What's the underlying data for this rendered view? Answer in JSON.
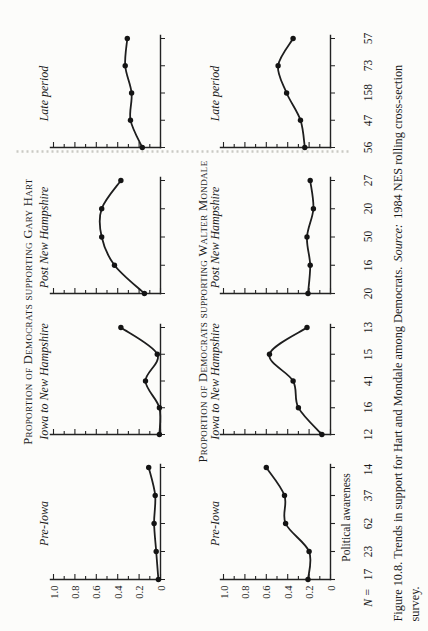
{
  "chart_data": {
    "type": "line",
    "figure_kind": "small-multiples",
    "panel_labels": [
      "Pre-Iowa",
      "Iowa to New Hampshire",
      "Post New Hampshire",
      "Late period"
    ],
    "x_axis": {
      "label": "Political awareness",
      "n_label": "N =",
      "n_values": [
        [
          "17",
          "23",
          "62",
          "37",
          "14"
        ],
        [
          "12",
          "16",
          "41",
          "15",
          "13"
        ],
        [
          "20",
          "16",
          "50",
          "20",
          "27"
        ],
        [
          "56",
          "47",
          "158",
          "73",
          "57"
        ]
      ]
    },
    "y_axis": {
      "ticks": [
        "1.0",
        "0.8",
        "0.6",
        "0.4",
        "0.2",
        "0"
      ],
      "range": [
        0,
        1
      ],
      "minor_tick_step": 0.1
    },
    "rows": [
      {
        "title": "Proportion of Democrats supporting Gary Hart",
        "series": [
          {
            "panel": "Pre-Iowa",
            "values": [
              0.02,
              0.04,
              0.06,
              0.05,
              0.11
            ]
          },
          {
            "panel": "Iowa to New Hampshire",
            "values": [
              0.01,
              0.01,
              0.14,
              0.03,
              0.37
            ]
          },
          {
            "panel": "Post New Hampshire",
            "values": [
              0.15,
              0.43,
              0.55,
              0.55,
              0.37
            ]
          },
          {
            "panel": "Late period",
            "values": [
              0.17,
              0.28,
              0.27,
              0.33,
              0.31
            ]
          }
        ]
      },
      {
        "title": "Proportion of Democrats supporting Walter Mondale",
        "series": [
          {
            "panel": "Pre-Iowa",
            "values": [
              0.21,
              0.2,
              0.42,
              0.43,
              0.6
            ]
          },
          {
            "panel": "Iowa to New Hampshire",
            "values": [
              0.08,
              0.3,
              0.35,
              0.57,
              0.22
            ]
          },
          {
            "panel": "Post New Hampshire",
            "values": [
              0.21,
              0.19,
              0.22,
              0.16,
              0.19
            ]
          },
          {
            "panel": "Late period",
            "values": [
              0.24,
              0.28,
              0.41,
              0.49,
              0.35
            ]
          }
        ]
      }
    ]
  },
  "caption": {
    "before_source": "Figure 10.8. Trends in support for Hart and Mondale among Democrats.",
    "source_label": "Source:",
    "after_source": "1984 NES rolling cross-section",
    "line2": "survey."
  }
}
